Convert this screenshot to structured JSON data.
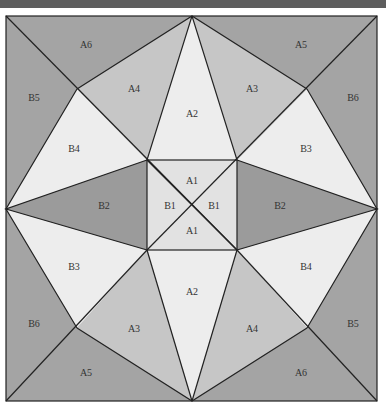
{
  "colors": {
    "dark": "#a4a4a4",
    "medium": "#c6c6c6",
    "light": "#ededed",
    "darker": "#9b9b9b",
    "center": "#e2e2e2",
    "line": "#222222",
    "topbar": "#5e5e5e"
  },
  "labels": {
    "a6_top": "A6",
    "a5_top": "A5",
    "a4_top": "A4",
    "a3_top": "A3",
    "a2_top": "A2",
    "b5_left": "B5",
    "b6_right": "B6",
    "b4_left": "B4",
    "b3_right": "B3",
    "b2_left": "B2",
    "b2_right": "B2",
    "a1_top": "A1",
    "b1_left": "B1",
    "b1_right": "B1",
    "a1_bottom": "A1",
    "b3_left": "B3",
    "b4_right": "B4",
    "a2_bottom": "A2",
    "b6_left": "B6",
    "b5_right": "B5",
    "a3_bottom": "A3",
    "a4_bottom": "A4",
    "a5_bottom": "A5",
    "a6_bottom": "A6"
  }
}
